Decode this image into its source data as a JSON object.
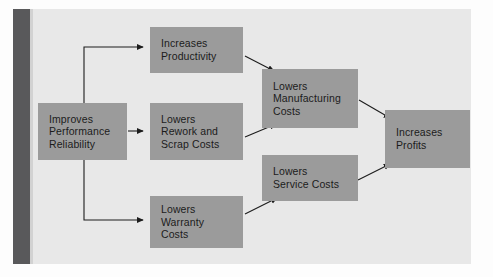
{
  "figure": {
    "type": "flow-diagram",
    "orientation": "left-to-right",
    "background_color": "#e8e8e8",
    "node_color": "#9b9b9b",
    "text_color": "#1c1c1c",
    "connector_color": "#1c1c1c",
    "spine_color": "#59595b"
  },
  "nodes": [
    {
      "id": "reliability",
      "label": "Improves\nPerformance\nReliability"
    },
    {
      "id": "productivity",
      "label": "Increases\nProductivity"
    },
    {
      "id": "rework",
      "label": "Lowers\nRework and\nScrap Costs"
    },
    {
      "id": "warranty",
      "label": "Lowers\nWarranty\nCosts"
    },
    {
      "id": "manufacturing",
      "label": "Lowers\nManufacturing\nCosts"
    },
    {
      "id": "service",
      "label": "Lowers\nService Costs"
    },
    {
      "id": "profits",
      "label": "Increases\nProfits"
    }
  ],
  "edges": [
    {
      "from": "reliability",
      "to": "productivity",
      "style": "elbow-up"
    },
    {
      "from": "reliability",
      "to": "rework",
      "style": "straight"
    },
    {
      "from": "reliability",
      "to": "warranty",
      "style": "elbow-down"
    },
    {
      "from": "productivity",
      "to": "manufacturing",
      "style": "diagonal-down"
    },
    {
      "from": "rework",
      "to": "manufacturing",
      "style": "diagonal-up"
    },
    {
      "from": "warranty",
      "to": "service",
      "style": "diagonal-up"
    },
    {
      "from": "manufacturing",
      "to": "profits",
      "style": "diagonal-down"
    },
    {
      "from": "service",
      "to": "profits",
      "style": "diagonal-up"
    }
  ]
}
